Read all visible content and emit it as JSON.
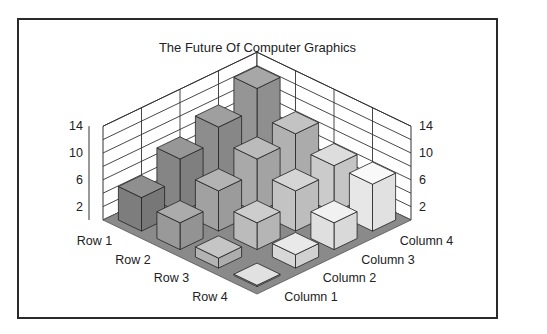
{
  "chart_data": {
    "type": "bar3d",
    "title": "The Future Of Computer Graphics",
    "rows": [
      "Row 1",
      "Row 2",
      "Row 3",
      "Row 4"
    ],
    "columns": [
      "Column 1",
      "Column 2",
      "Column 3",
      "Column 4"
    ],
    "series": [
      {
        "name": "Row 1",
        "values": [
          5,
          8,
          10,
          13
        ]
      },
      {
        "name": "Row 2",
        "values": [
          4,
          6,
          8,
          9
        ]
      },
      {
        "name": "Row 3",
        "values": [
          1.5,
          4,
          6,
          7
        ]
      },
      {
        "name": "Row 4",
        "values": [
          0.2,
          2,
          4,
          7
        ]
      }
    ],
    "z_ticks": [
      2,
      6,
      10,
      14
    ],
    "z_gridlines": [
      0,
      2,
      4,
      6,
      8,
      10,
      12,
      14
    ],
    "zlim": [
      0,
      14
    ],
    "grid": true,
    "xlabel": "",
    "ylabel": "",
    "zlabel": ""
  },
  "colors": {
    "floor": "#8a8a8a",
    "wall_lines": "#333333",
    "row_shades": [
      "#7d7d7d",
      "#999999",
      "#b3b3b3",
      "#cfcfcf"
    ],
    "col_lighten": [
      0,
      8,
      16,
      24
    ],
    "frame": "#2a2a2a"
  }
}
